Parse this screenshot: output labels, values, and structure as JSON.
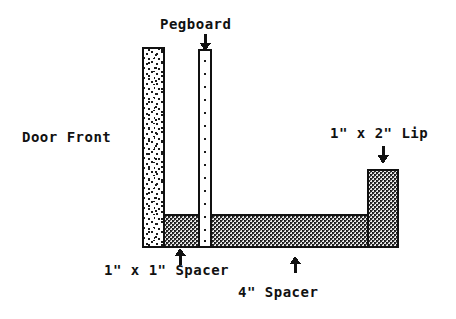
{
  "diagram": {
    "labels": {
      "pegboard": "Pegboard",
      "door_front": "Door Front",
      "lip": "1\" x 2\" Lip",
      "spacer_1x1": "1\" x 1\" Spacer",
      "spacer_4": "4\" Spacer"
    },
    "parts": [
      {
        "id": "door-front",
        "name": "Door Front",
        "fill": "stipple",
        "x": 143,
        "y": 48,
        "w": 21,
        "h": 199
      },
      {
        "id": "pegboard",
        "name": "Pegboard",
        "fill": "holes",
        "x": 199,
        "y": 50,
        "w": 12,
        "h": 197
      },
      {
        "id": "spacer-1x1",
        "name": "1\" x 1\" Spacer",
        "fill": "hatch",
        "x": 163,
        "y": 215,
        "w": 36,
        "h": 32
      },
      {
        "id": "spacer-4",
        "name": "4\" Spacer",
        "fill": "hatch",
        "x": 211,
        "y": 215,
        "w": 157,
        "h": 32
      },
      {
        "id": "lip-1x2",
        "name": "1\" x 2\" Lip",
        "fill": "hatch",
        "x": 368,
        "y": 170,
        "w": 30,
        "h": 77
      }
    ],
    "arrows": [
      {
        "id": "arrow-pegboard",
        "direction": "down",
        "x": 205,
        "y": 36
      },
      {
        "id": "arrow-lip",
        "direction": "down",
        "x": 383,
        "y": 148
      },
      {
        "id": "arrow-spacer1",
        "direction": "up",
        "x": 180,
        "y": 250
      },
      {
        "id": "arrow-spacer4",
        "direction": "up",
        "x": 295,
        "y": 256
      }
    ],
    "colors": {
      "ink": "#111111",
      "paper": "#ffffff",
      "hatch_dark": "#3a3a3a",
      "stipple_dot": "#1a1a1a"
    }
  }
}
